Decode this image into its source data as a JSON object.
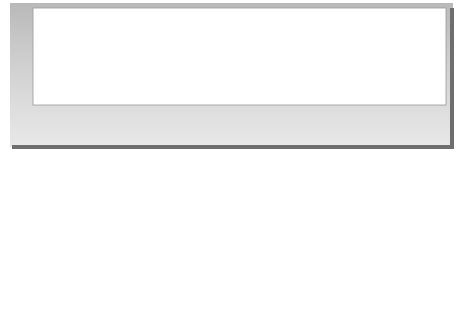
{
  "diagram": {
    "axes": {
      "y_label": "Potential energy",
      "x_label": "Reaction progress"
    },
    "transition_state": {
      "species": "A ---- B ---- C",
      "label": "(Transition state)"
    },
    "reactants": {
      "species": "A + BC",
      "label": "(Reactants)"
    },
    "products": {
      "species": "AB + C",
      "label": "(Products)"
    },
    "annotations": {
      "activation_energy_symbol": "E",
      "activation_energy_subscript": "a",
      "energy_change": "ΔE"
    },
    "colors": {
      "frame_dark": "#6e6e6e",
      "frame_gray": "#c8c8c8",
      "plot_bg": "#ffffff",
      "curve": "#1e1e1e",
      "label_text": "#4a4a4a"
    }
  }
}
